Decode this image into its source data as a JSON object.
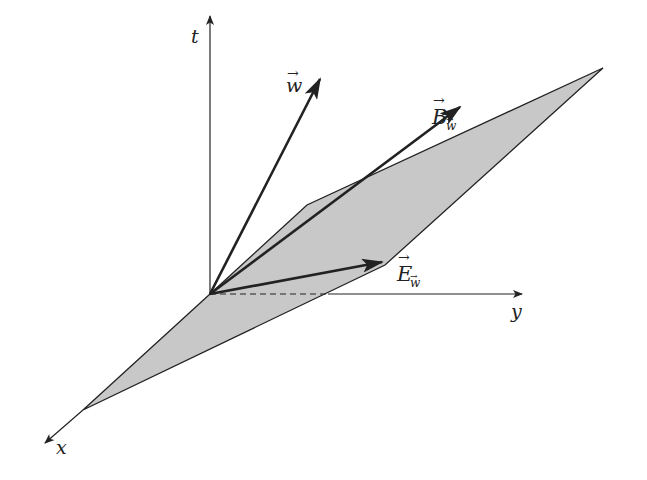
{
  "diagram": {
    "type": "spacetime-vector-diagram",
    "axes": {
      "t": {
        "label": "t",
        "from": [
          210,
          294
        ],
        "to": [
          210,
          16
        ]
      },
      "y": {
        "label": "y",
        "from": [
          328,
          294
        ],
        "to": [
          523,
          294
        ],
        "dashed_from": [
          210,
          294
        ],
        "dashed_to": [
          328,
          294
        ]
      },
      "x": {
        "label": "x",
        "from": [
          83,
          410
        ],
        "to": [
          45,
          443
        ]
      }
    },
    "plane": {
      "fill": "#c8c8c8",
      "stroke": "#222222",
      "points": [
        [
          210,
          294
        ],
        [
          307,
          205
        ],
        [
          603,
          68
        ],
        [
          385,
          265
        ],
        [
          83,
          410
        ]
      ]
    },
    "vectors": [
      {
        "name": "w",
        "label": "w",
        "subscript": "",
        "from": [
          210,
          294
        ],
        "to": [
          320,
          79
        ],
        "label_pos": [
          287,
          90
        ]
      },
      {
        "name": "B_w",
        "label": "B",
        "subscript": "w",
        "from": [
          210,
          294
        ],
        "to": [
          460,
          107
        ],
        "label_pos": [
          433,
          125
        ]
      },
      {
        "name": "E_w",
        "label": "E",
        "subscript": "w",
        "from": [
          210,
          294
        ],
        "to": [
          382,
          262
        ],
        "label_pos": [
          397,
          280
        ]
      }
    ],
    "labels": {
      "t": "t",
      "y": "y",
      "x": "x",
      "w": "w",
      "B": "B",
      "E": "E",
      "sub_w": "w",
      "arrow": "→"
    }
  }
}
